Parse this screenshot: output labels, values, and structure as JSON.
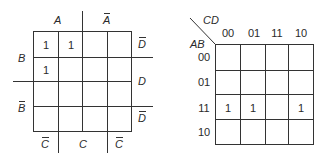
{
  "left_map": {
    "top_labels": {
      "a": "A",
      "a_bar": "A"
    },
    "left_labels": {
      "b": "B",
      "b_bar": "B"
    },
    "right_labels": [
      "D",
      "D",
      "D"
    ],
    "right_labels_bar": [
      true,
      false,
      true
    ],
    "bottom_labels": [
      "C",
      "C",
      "C"
    ],
    "bottom_labels_bar": [
      true,
      false,
      true
    ],
    "cells": [
      [
        "1",
        "1",
        "",
        ""
      ],
      [
        "1",
        "",
        "",
        ""
      ],
      [
        "",
        "",
        "",
        ""
      ],
      [
        "",
        "",
        "",
        ""
      ]
    ]
  },
  "right_map": {
    "col_var": "CD",
    "row_var": "AB",
    "col_headers": [
      "00",
      "01",
      "11",
      "10"
    ],
    "row_headers": [
      "00",
      "01",
      "11",
      "10"
    ],
    "cells": [
      [
        "",
        "",
        "",
        ""
      ],
      [
        "",
        "",
        "",
        ""
      ],
      [
        "1",
        "1",
        "",
        "1"
      ],
      [
        "",
        "",
        "",
        ""
      ]
    ]
  }
}
